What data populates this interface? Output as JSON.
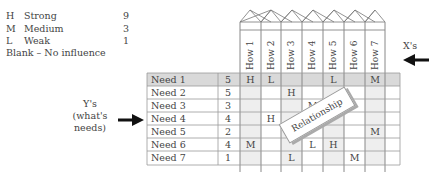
{
  "legend": {
    "items": [
      {
        "code": "H",
        "label": "Strong",
        "value": "9"
      },
      {
        "code": "M",
        "label": "Medium",
        "value": "3"
      },
      {
        "code": "L",
        "label": "Weak",
        "value": "1"
      }
    ],
    "blank": "Blank – No influence"
  },
  "y_label": {
    "line1": "Y's",
    "line2": "(what's",
    "line3": "needs)"
  },
  "x_label": "X's",
  "overlay_label": "Relationship",
  "hows": [
    "How 1",
    "How 2",
    "How 3",
    "How 4",
    "How 5",
    "How 6",
    "How 7"
  ],
  "needs": [
    {
      "name": "Need 1",
      "weight": "5",
      "cells": [
        "H",
        "L",
        "",
        "",
        "L",
        "",
        "M"
      ]
    },
    {
      "name": "Need 2",
      "weight": "5",
      "cells": [
        "",
        "",
        "H",
        "",
        "",
        "",
        ""
      ]
    },
    {
      "name": "Need 3",
      "weight": "3",
      "cells": [
        "",
        "",
        "",
        "M",
        "",
        "",
        ""
      ]
    },
    {
      "name": "Need 4",
      "weight": "4",
      "cells": [
        "",
        "H",
        "",
        "",
        "",
        "",
        ""
      ]
    },
    {
      "name": "Need 5",
      "weight": "2",
      "cells": [
        "",
        "",
        "",
        "",
        "",
        "",
        "M"
      ]
    },
    {
      "name": "Need 6",
      "weight": "4",
      "cells": [
        "M",
        "",
        "",
        "L",
        "H",
        "",
        ""
      ]
    },
    {
      "name": "Need 7",
      "weight": "1",
      "cells": [
        "",
        "",
        "L",
        "",
        "",
        "M",
        ""
      ]
    }
  ]
}
